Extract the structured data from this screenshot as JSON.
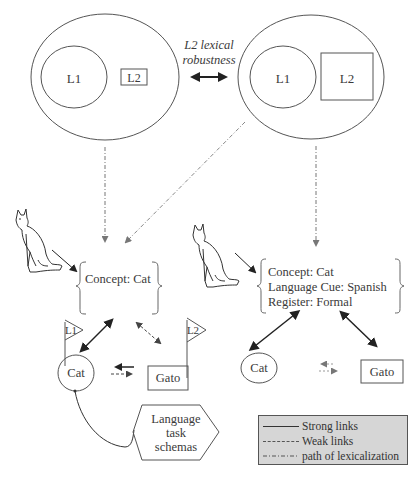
{
  "top_left_model": {
    "inner_circle_label": "L1",
    "box_label": "L2"
  },
  "top_right_model": {
    "inner_circle_label": "L1",
    "box_label": "L2"
  },
  "robustness_label": {
    "line1": "L2 lexical",
    "line2": "robustness"
  },
  "left_model": {
    "concept_lines": [
      "Concept: Cat"
    ],
    "flag_l1": "L1",
    "flag_l2": "L2",
    "word_l1": "Cat",
    "word_l2": "Gato",
    "schema_lines": [
      "Language",
      "task",
      "schemas"
    ]
  },
  "right_model": {
    "concept_lines": [
      "Concept: Cat",
      "Language Cue: Spanish",
      "Register: Formal"
    ],
    "word_l1": "Cat",
    "word_l2": "Gato"
  },
  "legend": {
    "items": [
      {
        "label": "Strong links",
        "style": "solid"
      },
      {
        "label": "Weak links",
        "style": "dashed"
      },
      {
        "label": "path of lexicalization",
        "style": "dash-dot"
      }
    ],
    "background": "#d6d6d6"
  },
  "colors": {
    "stroke": "#555555",
    "arrow": "#222222",
    "dotted": "#777777"
  }
}
